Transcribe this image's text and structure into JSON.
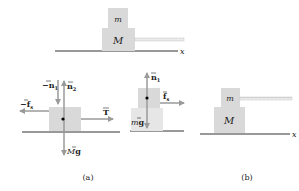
{
  "colors": {
    "block": "#d9d9d9",
    "arrow": "#9a9a9a",
    "ground": "#333333",
    "rope": "#c8c8c8",
    "text": "#222222"
  },
  "top_figure": {
    "upper_block_label": "m",
    "lower_block_label": "M",
    "axis_label": "x"
  },
  "figure_a": {
    "caption": "(a)",
    "lower_block_fbd": {
      "forces": [
        {
          "label": "−n₁",
          "direction": "down"
        },
        {
          "label": "n₂",
          "direction": "up"
        },
        {
          "label": "−f",
          "subscript": "s",
          "direction": "left"
        },
        {
          "label": "T",
          "direction": "right"
        },
        {
          "label": "Mg",
          "direction": "down"
        }
      ]
    },
    "upper_block_fbd": {
      "forces": [
        {
          "label": "n₁",
          "direction": "up"
        },
        {
          "label": "f",
          "subscript": "s",
          "direction": "right"
        },
        {
          "label": "mg",
          "direction": "down"
        }
      ]
    }
  },
  "figure_b": {
    "caption": "(b)",
    "upper_block_label": "m",
    "lower_block_label": "M",
    "axis_label": "x"
  }
}
